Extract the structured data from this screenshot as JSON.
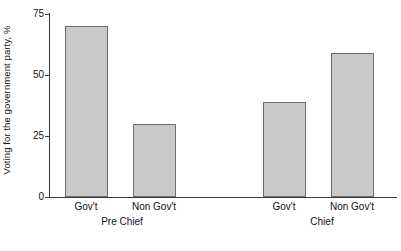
{
  "chart_data": {
    "type": "bar",
    "title": "",
    "subtitle": "",
    "xlabel": "",
    "ylabel": "Voting for the government party, %",
    "ylim": [
      0,
      75
    ],
    "yticks": [
      0,
      25,
      50,
      75
    ],
    "ytick_labels": [
      "0",
      "25",
      "50",
      "75"
    ],
    "grid": false,
    "legend": false,
    "legend_position": "none",
    "groups": [
      "Pre Chief",
      "Chief"
    ],
    "categories": [
      "Gov't",
      "Non Gov't"
    ],
    "bars": [
      {
        "group": "Pre Chief",
        "category": "Gov't",
        "value": 70
      },
      {
        "group": "Pre Chief",
        "category": "Non Gov't",
        "value": 30
      },
      {
        "group": "Chief",
        "category": "Gov't",
        "value": 39
      },
      {
        "group": "Chief",
        "category": "Non Gov't",
        "value": 59
      }
    ],
    "series": [
      {
        "name": "Pre Chief",
        "values": [
          70,
          30
        ]
      },
      {
        "name": "Chief",
        "values": [
          39,
          59
        ]
      }
    ],
    "colors": {
      "bar_fill": "#c9c9c9",
      "bar_border": "#6e6e6e",
      "axis": "#3a3a3a",
      "text": "#111111",
      "background": "#ffffff"
    }
  },
  "axis": {
    "y_title": "Voting for the government party, %",
    "ticks": [
      {
        "label": "75",
        "value": 75
      },
      {
        "label": "50",
        "value": 50
      },
      {
        "label": "25",
        "value": 25
      },
      {
        "label": "0",
        "value": 0
      }
    ]
  },
  "x_axis": {
    "category_labels": [
      "Gov't",
      "Non Gov't",
      "Gov't",
      "Non Gov't"
    ],
    "group_labels": [
      "Pre Chief",
      "Chief"
    ]
  }
}
